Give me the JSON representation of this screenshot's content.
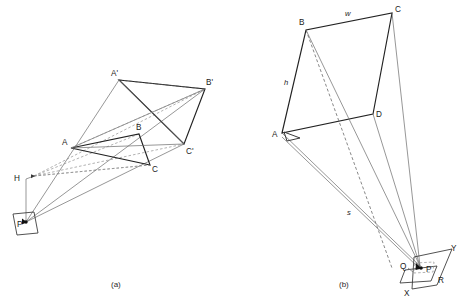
{
  "figure": {
    "captions": [
      {
        "id": "caption-a",
        "text": "(a)",
        "x": 114,
        "y": 286
      },
      {
        "id": "caption-b",
        "text": "(b)",
        "x": 342,
        "y": 286
      }
    ]
  },
  "panel_a": {
    "name": "panel-a-triangle-projection",
    "point_labels": [
      {
        "key": "A",
        "text": "A",
        "x": 62,
        "y": 145
      },
      {
        "key": "B",
        "text": "B",
        "x": 136,
        "y": 130
      },
      {
        "key": "C",
        "text": "C",
        "x": 152,
        "y": 170
      },
      {
        "key": "Ap",
        "text": "A'",
        "x": 112,
        "y": 76
      },
      {
        "key": "Bp",
        "text": "B'",
        "x": 207,
        "y": 85
      },
      {
        "key": "Cp",
        "text": "C'",
        "x": 186,
        "y": 152
      },
      {
        "key": "H",
        "text": "H",
        "x": 15,
        "y": 181
      },
      {
        "key": "P",
        "text": "P",
        "x": 18,
        "y": 227
      }
    ],
    "vertices": {
      "A": {
        "x": 71,
        "y": 148
      },
      "B": {
        "x": 139,
        "y": 134
      },
      "C": {
        "x": 150,
        "y": 165
      },
      "Ap": {
        "x": 119,
        "y": 80
      },
      "Bp": {
        "x": 205,
        "y": 89
      },
      "Cp": {
        "x": 184,
        "y": 144
      },
      "H": {
        "x": 34,
        "y": 176
      },
      "P": {
        "x": 26,
        "y": 222
      }
    },
    "plane_quad": [
      {
        "x": 13,
        "y": 214
      },
      {
        "x": 34,
        "y": 212
      },
      {
        "x": 38,
        "y": 233
      },
      {
        "x": 17,
        "y": 235
      }
    ],
    "notes": "Center of projection P on ground plane; H is the vanishing/horizon reference. Triangle ABC projects to A'B'C'."
  },
  "panel_b": {
    "name": "panel-b-rectangle-projection",
    "point_labels": [
      {
        "key": "A",
        "text": "A",
        "x": 273,
        "y": 136
      },
      {
        "key": "B",
        "text": "B",
        "x": 300,
        "y": 24
      },
      {
        "key": "C",
        "text": "C",
        "x": 396,
        "y": 12
      },
      {
        "key": "D",
        "text": "D",
        "x": 376,
        "y": 116
      },
      {
        "key": "Q",
        "text": "Q",
        "x": 402,
        "y": 267
      },
      {
        "key": "P",
        "text": "P",
        "x": 428,
        "y": 272
      },
      {
        "key": "X",
        "text": "X",
        "x": 405,
        "y": 293
      },
      {
        "key": "Y",
        "text": "Y",
        "x": 450,
        "y": 250
      },
      {
        "key": "R",
        "text": "R",
        "x": 439,
        "y": 281
      }
    ],
    "dimension_labels": [
      {
        "key": "w",
        "text": "w",
        "x": 346,
        "y": 15
      },
      {
        "key": "h",
        "text": "h",
        "x": 285,
        "y": 84
      },
      {
        "key": "s",
        "text": "s",
        "x": 348,
        "y": 214
      }
    ],
    "vertices": {
      "A": {
        "x": 282,
        "y": 133
      },
      "B": {
        "x": 306,
        "y": 30
      },
      "C": {
        "x": 392,
        "y": 13
      },
      "D": {
        "x": 373,
        "y": 114
      },
      "Q": {
        "x": 409,
        "y": 265
      },
      "P": {
        "x": 424,
        "y": 270
      },
      "X": {
        "x": 411,
        "y": 290
      },
      "Y": {
        "x": 448,
        "y": 252
      },
      "R": {
        "x": 435,
        "y": 279
      }
    },
    "big_plane_quad": [
      {
        "x": 414,
        "y": 257
      },
      {
        "x": 452,
        "y": 249
      },
      {
        "x": 437,
        "y": 285
      },
      {
        "x": 412,
        "y": 289
      }
    ],
    "small_plane_quad": [
      {
        "x": 405,
        "y": 270
      },
      {
        "x": 437,
        "y": 266
      },
      {
        "x": 431,
        "y": 281
      },
      {
        "x": 400,
        "y": 283
      }
    ],
    "notes": "Rectangle ABCD of width w and height h viewed from distance s; projected onto the picture plane QXYR with station point P."
  },
  "colors": {
    "ink_dark": "#222222",
    "ink_mid": "#3a3a3a",
    "ink_light": "#6a6a6a",
    "dashed": "#8a8a8a",
    "background": "#ffffff"
  }
}
